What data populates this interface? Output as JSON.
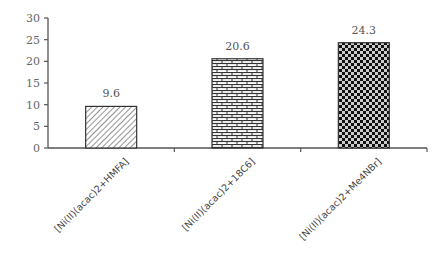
{
  "chart_data": {
    "type": "bar",
    "title": "",
    "xlabel": "",
    "ylabel": "",
    "ylim": [
      0,
      30
    ],
    "yticks": [
      0,
      5,
      10,
      15,
      20,
      25,
      30
    ],
    "grid": false,
    "legend": null,
    "categories": [
      "[Ni(II)(acac)2+HMFA]",
      "[Ni(II)(acac)2+18C6]",
      "[Ni(II)(acac)2+Me4NBr]"
    ],
    "values": [
      9.6,
      20.6,
      24.3
    ],
    "value_labels": [
      "9.6",
      "20.6",
      "24.3"
    ],
    "patterns": [
      "diagonal-hatch",
      "brick",
      "checkerboard"
    ]
  },
  "colors": {
    "axis": "#555555",
    "bar_outline": "#333333",
    "pattern_dark": "#111111",
    "pattern_light": "#ffffff"
  }
}
